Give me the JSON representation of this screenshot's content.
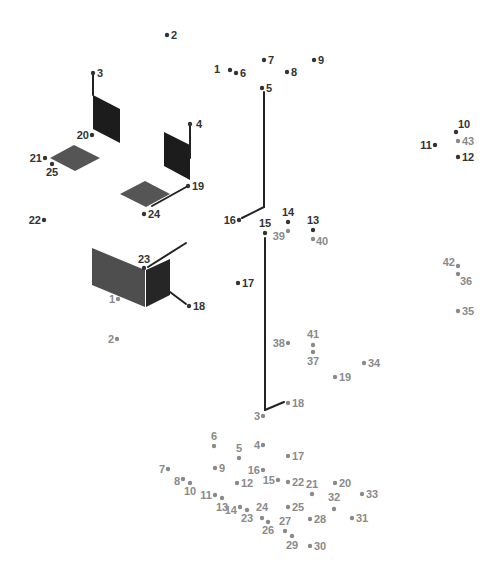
{
  "puzzle": {
    "title": "Connect the dots",
    "colors": {
      "dark_dot": "#333333",
      "light_dot": "#8a8a8a",
      "line": "#222222",
      "fill_dark": "#1c1c1c",
      "fill_gray": "#555555",
      "fill_mid": "#444444"
    },
    "dark_set": [
      {
        "n": "1",
        "x": 230,
        "y": 70,
        "lx": -10,
        "ly": 3,
        "anchor": "end"
      },
      {
        "n": "2",
        "x": 167,
        "y": 35,
        "lx": 4,
        "ly": 4,
        "anchor": "start"
      },
      {
        "n": "3",
        "x": 93,
        "y": 73,
        "lx": 4,
        "ly": 4,
        "anchor": "start"
      },
      {
        "n": "4",
        "x": 190,
        "y": 124,
        "lx": 6,
        "ly": 4,
        "anchor": "start"
      },
      {
        "n": "5",
        "x": 262,
        "y": 88,
        "lx": 4,
        "ly": 4,
        "anchor": "start"
      },
      {
        "n": "6",
        "x": 236,
        "y": 73,
        "lx": 4,
        "ly": 4,
        "anchor": "start"
      },
      {
        "n": "7",
        "x": 264,
        "y": 60,
        "lx": 4,
        "ly": 4,
        "anchor": "start"
      },
      {
        "n": "8",
        "x": 287,
        "y": 72,
        "lx": 4,
        "ly": 4,
        "anchor": "start"
      },
      {
        "n": "9",
        "x": 314,
        "y": 60,
        "lx": 4,
        "ly": 4,
        "anchor": "start"
      },
      {
        "n": "10",
        "x": 456,
        "y": 132,
        "lx": 2,
        "ly": -4,
        "anchor": "start"
      },
      {
        "n": "11",
        "x": 435,
        "y": 145,
        "lx": -3,
        "ly": 4,
        "anchor": "end"
      },
      {
        "n": "12",
        "x": 458,
        "y": 157,
        "lx": 4,
        "ly": 4,
        "anchor": "start"
      },
      {
        "n": "13",
        "x": 313,
        "y": 230,
        "lx": 0,
        "ly": -6,
        "anchor": "middle"
      },
      {
        "n": "14",
        "x": 288,
        "y": 222,
        "lx": 0,
        "ly": -6,
        "anchor": "middle"
      },
      {
        "n": "15",
        "x": 265,
        "y": 233,
        "lx": 0,
        "ly": -6,
        "anchor": "middle"
      },
      {
        "n": "16",
        "x": 239,
        "y": 220,
        "lx": -3,
        "ly": 4,
        "anchor": "end"
      },
      {
        "n": "17",
        "x": 238,
        "y": 283,
        "lx": 4,
        "ly": 4,
        "anchor": "start"
      },
      {
        "n": "18",
        "x": 189,
        "y": 306,
        "lx": 4,
        "ly": 4,
        "anchor": "start"
      },
      {
        "n": "19",
        "x": 188,
        "y": 186,
        "lx": 4,
        "ly": 4,
        "anchor": "start"
      },
      {
        "n": "20",
        "x": 92,
        "y": 135,
        "lx": -3,
        "ly": 4,
        "anchor": "end"
      },
      {
        "n": "21",
        "x": 45,
        "y": 158,
        "lx": -3,
        "ly": 4,
        "anchor": "end"
      },
      {
        "n": "22",
        "x": 44,
        "y": 220,
        "lx": -3,
        "ly": 4,
        "anchor": "end"
      },
      {
        "n": "23",
        "x": 144,
        "y": 268,
        "lx": 0,
        "ly": -5,
        "anchor": "middle"
      },
      {
        "n": "24",
        "x": 144,
        "y": 214,
        "lx": 4,
        "ly": 4,
        "anchor": "start"
      },
      {
        "n": "25",
        "x": 52,
        "y": 164,
        "lx": 0,
        "ly": 12,
        "anchor": "middle"
      }
    ],
    "light_set": [
      {
        "n": "1",
        "x": 118,
        "y": 299,
        "lx": -3,
        "ly": 4,
        "anchor": "end"
      },
      {
        "n": "2",
        "x": 117,
        "y": 339,
        "lx": -3,
        "ly": 4,
        "anchor": "end"
      },
      {
        "n": "3",
        "x": 263,
        "y": 416,
        "lx": -3,
        "ly": 4,
        "anchor": "end"
      },
      {
        "n": "4",
        "x": 263,
        "y": 445,
        "lx": -3,
        "ly": 4,
        "anchor": "end"
      },
      {
        "n": "5",
        "x": 239,
        "y": 458,
        "lx": 0,
        "ly": -6,
        "anchor": "middle"
      },
      {
        "n": "6",
        "x": 214,
        "y": 446,
        "lx": 0,
        "ly": -6,
        "anchor": "middle"
      },
      {
        "n": "7",
        "x": 168,
        "y": 469,
        "lx": -3,
        "ly": 4,
        "anchor": "end"
      },
      {
        "n": "8",
        "x": 183,
        "y": 479,
        "lx": -3,
        "ly": 6,
        "anchor": "end"
      },
      {
        "n": "9",
        "x": 215,
        "y": 468,
        "lx": 4,
        "ly": 4,
        "anchor": "start"
      },
      {
        "n": "10",
        "x": 190,
        "y": 483,
        "lx": 0,
        "ly": 12,
        "anchor": "middle"
      },
      {
        "n": "11",
        "x": 215,
        "y": 495,
        "lx": -3,
        "ly": 4,
        "anchor": "end"
      },
      {
        "n": "12",
        "x": 237,
        "y": 483,
        "lx": 4,
        "ly": 4,
        "anchor": "start"
      },
      {
        "n": "13",
        "x": 222,
        "y": 498,
        "lx": 0,
        "ly": 13,
        "anchor": "middle"
      },
      {
        "n": "14",
        "x": 240,
        "y": 507,
        "lx": -3,
        "ly": 7,
        "anchor": "end"
      },
      {
        "n": "15",
        "x": 278,
        "y": 480,
        "lx": -3,
        "ly": 4,
        "anchor": "end"
      },
      {
        "n": "16",
        "x": 263,
        "y": 470,
        "lx": -3,
        "ly": 4,
        "anchor": "end"
      },
      {
        "n": "17",
        "x": 288,
        "y": 456,
        "lx": 4,
        "ly": 4,
        "anchor": "start"
      },
      {
        "n": "18",
        "x": 288,
        "y": 403,
        "lx": 4,
        "ly": 4,
        "anchor": "start"
      },
      {
        "n": "19",
        "x": 335,
        "y": 377,
        "lx": 4,
        "ly": 4,
        "anchor": "start"
      },
      {
        "n": "20",
        "x": 335,
        "y": 483,
        "lx": 4,
        "ly": 4,
        "anchor": "start"
      },
      {
        "n": "21",
        "x": 312,
        "y": 494,
        "lx": 0,
        "ly": -6,
        "anchor": "middle"
      },
      {
        "n": "22",
        "x": 288,
        "y": 482,
        "lx": 4,
        "ly": 4,
        "anchor": "start"
      },
      {
        "n": "23",
        "x": 247,
        "y": 510,
        "lx": 0,
        "ly": 12,
        "anchor": "middle"
      },
      {
        "n": "24",
        "x": 262,
        "y": 518,
        "lx": 0,
        "ly": -7,
        "anchor": "middle"
      },
      {
        "n": "25",
        "x": 288,
        "y": 507,
        "lx": 4,
        "ly": 4,
        "anchor": "start"
      },
      {
        "n": "26",
        "x": 268,
        "y": 522,
        "lx": 0,
        "ly": 12,
        "anchor": "middle"
      },
      {
        "n": "27",
        "x": 285,
        "y": 531,
        "lx": 0,
        "ly": -6,
        "anchor": "middle"
      },
      {
        "n": "28",
        "x": 310,
        "y": 519,
        "lx": 4,
        "ly": 4,
        "anchor": "start"
      },
      {
        "n": "29",
        "x": 292,
        "y": 536,
        "lx": 0,
        "ly": 13,
        "anchor": "middle"
      },
      {
        "n": "30",
        "x": 310,
        "y": 546,
        "lx": 4,
        "ly": 4,
        "anchor": "start"
      },
      {
        "n": "31",
        "x": 352,
        "y": 518,
        "lx": 4,
        "ly": 4,
        "anchor": "start"
      },
      {
        "n": "32",
        "x": 334,
        "y": 509,
        "lx": 0,
        "ly": -8,
        "anchor": "middle"
      },
      {
        "n": "33",
        "x": 362,
        "y": 494,
        "lx": 4,
        "ly": 4,
        "anchor": "start"
      },
      {
        "n": "34",
        "x": 364,
        "y": 363,
        "lx": 4,
        "ly": 4,
        "anchor": "start"
      },
      {
        "n": "35",
        "x": 458,
        "y": 311,
        "lx": 4,
        "ly": 4,
        "anchor": "start"
      },
      {
        "n": "36",
        "x": 458,
        "y": 274,
        "lx": 2,
        "ly": 11,
        "anchor": "start"
      },
      {
        "n": "37",
        "x": 313,
        "y": 352,
        "lx": 0,
        "ly": 13,
        "anchor": "middle"
      },
      {
        "n": "38",
        "x": 288,
        "y": 343,
        "lx": -3,
        "ly": 4,
        "anchor": "end"
      },
      {
        "n": "39",
        "x": 288,
        "y": 231,
        "lx": -3,
        "ly": 9,
        "anchor": "end"
      },
      {
        "n": "40",
        "x": 313,
        "y": 239,
        "lx": 3,
        "ly": 6,
        "anchor": "start"
      },
      {
        "n": "41",
        "x": 313,
        "y": 345,
        "lx": 0,
        "ly": -7,
        "anchor": "middle"
      },
      {
        "n": "42",
        "x": 458,
        "y": 266,
        "lx": -3,
        "ly": 0,
        "anchor": "end"
      },
      {
        "n": "43",
        "x": 458,
        "y": 141,
        "lx": 4,
        "ly": 4,
        "anchor": "start"
      }
    ],
    "lines": [
      {
        "x1": 93,
        "y1": 73,
        "x2": 93,
        "y2": 95,
        "from": "dark-3"
      },
      {
        "x1": 190,
        "y1": 124,
        "x2": 190,
        "y2": 158,
        "from": "dark-4"
      },
      {
        "x1": 188,
        "y1": 186,
        "x2": 152,
        "y2": 206,
        "from": "dark-19-to-24"
      },
      {
        "x1": 264,
        "y1": 92,
        "x2": 264,
        "y2": 207,
        "from": "dark-5"
      },
      {
        "x1": 264,
        "y1": 207,
        "x2": 242,
        "y2": 218,
        "from": "dark-16"
      },
      {
        "x1": 265,
        "y1": 238,
        "x2": 265,
        "y2": 410,
        "from": "dark-15-to-light-3"
      },
      {
        "x1": 265,
        "y1": 410,
        "x2": 284,
        "y2": 402,
        "from": "light-3-to-18"
      },
      {
        "x1": 148,
        "y1": 267,
        "x2": 186,
        "y2": 243,
        "from": "dark-23"
      },
      {
        "x1": 170,
        "y1": 292,
        "x2": 186,
        "y2": 304,
        "from": "dark-18"
      }
    ],
    "shapes": [
      {
        "name": "left-dark-panel",
        "points": "93,95 120,109 120,143 93,129",
        "fill": "#1c1c1c"
      },
      {
        "name": "left-gray-tile",
        "points": "50,158 74,145 100,158 75,171",
        "fill": "#555555"
      },
      {
        "name": "center-dark-panel",
        "points": "164,132 190,145 190,180 164,166",
        "fill": "#1c1c1c"
      },
      {
        "name": "center-gray-tile",
        "points": "120,194 145,181 170,194 146,207",
        "fill": "#555555"
      },
      {
        "name": "block-front-face",
        "points": "92,248 145,270 145,307 92,285",
        "fill": "#4e4e4e"
      },
      {
        "name": "block-side-face",
        "points": "146,270 170,259 170,295 146,307",
        "fill": "#262626"
      }
    ]
  }
}
